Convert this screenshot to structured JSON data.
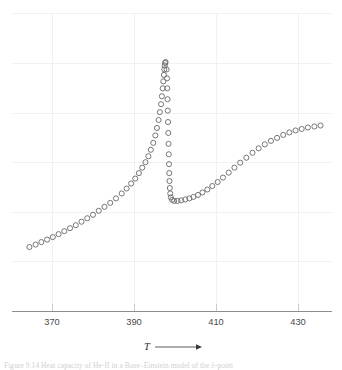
{
  "figure": {
    "background_color": "#ffffff",
    "marker_stroke_color": "#6f6f73",
    "gridline_color": "#f1f1f2",
    "axis_color": "#8d8d8d",
    "caption_fragment": "Figure 9.14 Heat capacity of He-II in a Bose–Einstein model of the λ-point"
  },
  "chart_data": {
    "type": "scatter",
    "title": "",
    "subtitle": "",
    "xlabel": "T",
    "ylabel": "",
    "xlabel_arrow": "⟶",
    "grid": true,
    "legend": null,
    "legend_position": "none",
    "marker": "open-circle",
    "xlim": [
      362,
      438
    ],
    "ylim": [
      0,
      6
    ],
    "xticks": [
      370,
      390,
      410,
      430
    ],
    "xtick_labels": [
      "370",
      "390",
      "410",
      "430"
    ],
    "yticks": [],
    "ytick_labels": [],
    "annotations": [],
    "points": [
      {
        "x": 364.5,
        "y": 1.3
      },
      {
        "x": 366.0,
        "y": 1.35
      },
      {
        "x": 367.4,
        "y": 1.4
      },
      {
        "x": 368.8,
        "y": 1.45
      },
      {
        "x": 370.2,
        "y": 1.5
      },
      {
        "x": 371.6,
        "y": 1.56
      },
      {
        "x": 373.0,
        "y": 1.62
      },
      {
        "x": 374.4,
        "y": 1.68
      },
      {
        "x": 375.8,
        "y": 1.74
      },
      {
        "x": 377.2,
        "y": 1.81
      },
      {
        "x": 378.6,
        "y": 1.88
      },
      {
        "x": 380.0,
        "y": 1.95
      },
      {
        "x": 381.4,
        "y": 2.03
      },
      {
        "x": 382.8,
        "y": 2.11
      },
      {
        "x": 384.2,
        "y": 2.19
      },
      {
        "x": 385.6,
        "y": 2.28
      },
      {
        "x": 387.0,
        "y": 2.38
      },
      {
        "x": 388.2,
        "y": 2.48
      },
      {
        "x": 389.3,
        "y": 2.58
      },
      {
        "x": 390.3,
        "y": 2.68
      },
      {
        "x": 391.2,
        "y": 2.79
      },
      {
        "x": 392.0,
        "y": 2.9
      },
      {
        "x": 392.8,
        "y": 3.01
      },
      {
        "x": 393.5,
        "y": 3.13
      },
      {
        "x": 394.1,
        "y": 3.26
      },
      {
        "x": 394.7,
        "y": 3.4
      },
      {
        "x": 395.2,
        "y": 3.55
      },
      {
        "x": 395.6,
        "y": 3.7
      },
      {
        "x": 396.0,
        "y": 3.86
      },
      {
        "x": 396.3,
        "y": 4.02
      },
      {
        "x": 396.6,
        "y": 4.18
      },
      {
        "x": 396.8,
        "y": 4.34
      },
      {
        "x": 397.0,
        "y": 4.5
      },
      {
        "x": 397.15,
        "y": 4.64
      },
      {
        "x": 397.3,
        "y": 4.77
      },
      {
        "x": 397.4,
        "y": 4.88
      },
      {
        "x": 397.5,
        "y": 4.96
      },
      {
        "x": 397.6,
        "y": 5.01
      },
      {
        "x": 397.7,
        "y": 5.03
      },
      {
        "x": 397.95,
        "y": 4.88
      },
      {
        "x": 398.05,
        "y": 4.7
      },
      {
        "x": 398.12,
        "y": 4.5
      },
      {
        "x": 398.18,
        "y": 4.28
      },
      {
        "x": 398.24,
        "y": 4.05
      },
      {
        "x": 398.3,
        "y": 3.82
      },
      {
        "x": 398.36,
        "y": 3.6
      },
      {
        "x": 398.42,
        "y": 3.38
      },
      {
        "x": 398.48,
        "y": 3.17
      },
      {
        "x": 398.54,
        "y": 2.97
      },
      {
        "x": 398.6,
        "y": 2.79
      },
      {
        "x": 398.66,
        "y": 2.63
      },
      {
        "x": 398.74,
        "y": 2.49
      },
      {
        "x": 398.84,
        "y": 2.38
      },
      {
        "x": 399.0,
        "y": 2.3
      },
      {
        "x": 399.3,
        "y": 2.25
      },
      {
        "x": 399.8,
        "y": 2.23
      },
      {
        "x": 400.6,
        "y": 2.23
      },
      {
        "x": 401.5,
        "y": 2.24
      },
      {
        "x": 402.5,
        "y": 2.26
      },
      {
        "x": 403.5,
        "y": 2.28
      },
      {
        "x": 404.5,
        "y": 2.31
      },
      {
        "x": 405.6,
        "y": 2.35
      },
      {
        "x": 406.7,
        "y": 2.4
      },
      {
        "x": 407.9,
        "y": 2.46
      },
      {
        "x": 409.1,
        "y": 2.53
      },
      {
        "x": 410.4,
        "y": 2.61
      },
      {
        "x": 411.7,
        "y": 2.7
      },
      {
        "x": 413.1,
        "y": 2.8
      },
      {
        "x": 414.5,
        "y": 2.9
      },
      {
        "x": 415.9,
        "y": 3.0
      },
      {
        "x": 417.4,
        "y": 3.1
      },
      {
        "x": 418.9,
        "y": 3.2
      },
      {
        "x": 420.4,
        "y": 3.29
      },
      {
        "x": 421.9,
        "y": 3.37
      },
      {
        "x": 423.4,
        "y": 3.44
      },
      {
        "x": 424.9,
        "y": 3.5
      },
      {
        "x": 426.4,
        "y": 3.56
      },
      {
        "x": 427.9,
        "y": 3.61
      },
      {
        "x": 429.4,
        "y": 3.65
      },
      {
        "x": 430.9,
        "y": 3.68
      },
      {
        "x": 432.4,
        "y": 3.71
      },
      {
        "x": 434.0,
        "y": 3.73
      },
      {
        "x": 435.5,
        "y": 3.75
      }
    ]
  }
}
